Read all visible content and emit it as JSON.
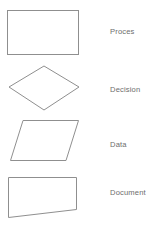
{
  "legend": {
    "stroke_color": "#8f8f8f",
    "fill_color": "#ffffff",
    "text_color": "#6d6d6d",
    "background_color": "#ffffff",
    "rows": [
      {
        "shape": "rectangle",
        "shape_name": "process-shape",
        "label": "Proces"
      },
      {
        "shape": "diamond",
        "shape_name": "decision-shape",
        "label": "Decision"
      },
      {
        "shape": "parallelogram",
        "shape_name": "data-shape",
        "label": "Data"
      },
      {
        "shape": "document",
        "shape_name": "document-shape",
        "label": "Document"
      }
    ]
  }
}
